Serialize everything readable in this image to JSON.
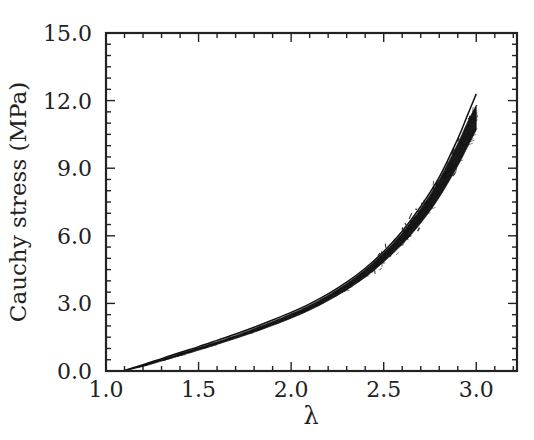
{
  "chart_data": {
    "type": "line",
    "title": "",
    "subtitle": "",
    "xlabel": "λ",
    "ylabel": "Cauchy stress (MPa)",
    "xlim": [
      1.0,
      3.22
    ],
    "ylim": [
      0.0,
      15.0
    ],
    "grid": false,
    "legend": null,
    "legend_position": "none",
    "x_ticks": [
      1.0,
      1.5,
      2.0,
      2.5,
      3.0
    ],
    "x_tick_labels": [
      "1.0",
      "1.5",
      "2.0",
      "2.5",
      "3.0"
    ],
    "y_ticks": [
      0.0,
      3.0,
      6.0,
      9.0,
      12.0,
      15.0
    ],
    "y_tick_labels": [
      "0.0",
      "3.0",
      "6.0",
      "9.0",
      "12.0",
      "15.0"
    ],
    "x_minor_tick_interval": 0.1,
    "y_minor_tick_interval": 0.5,
    "tick_direction": "in",
    "frame": "box",
    "line_color": "#111111",
    "band_color": "#111111",
    "annotations": [],
    "series": [
      {
        "name": "model-curve",
        "role": "upper smooth curve",
        "x": [
          1.09,
          1.2,
          1.3,
          1.4,
          1.5,
          1.6,
          1.7,
          1.8,
          1.9,
          2.0,
          2.1,
          2.2,
          2.3,
          2.4,
          2.5,
          2.6,
          2.7,
          2.8,
          2.9,
          2.95,
          3.0
        ],
        "values": [
          0.0,
          0.28,
          0.55,
          0.82,
          1.08,
          1.36,
          1.64,
          1.94,
          2.26,
          2.6,
          2.98,
          3.42,
          3.94,
          4.56,
          5.3,
          6.2,
          7.3,
          8.6,
          10.3,
          11.3,
          12.3
        ]
      },
      {
        "name": "experimental-band-upper",
        "role": "upper edge of experimental data bundle",
        "x": [
          1.09,
          1.2,
          1.3,
          1.4,
          1.5,
          1.6,
          1.7,
          1.8,
          1.9,
          2.0,
          2.1,
          2.2,
          2.3,
          2.4,
          2.5,
          2.6,
          2.7,
          2.8,
          2.9,
          2.95,
          3.0
        ],
        "values": [
          0.0,
          0.26,
          0.52,
          0.78,
          1.04,
          1.3,
          1.58,
          1.88,
          2.2,
          2.54,
          2.92,
          3.36,
          3.88,
          4.5,
          5.24,
          6.12,
          7.2,
          8.5,
          10.1,
          11.0,
          11.8
        ]
      },
      {
        "name": "experimental-band-lower",
        "role": "lower edge of experimental data bundle",
        "x": [
          1.09,
          1.2,
          1.3,
          1.4,
          1.5,
          1.6,
          1.7,
          1.8,
          1.9,
          2.0,
          2.1,
          2.2,
          2.3,
          2.4,
          2.5,
          2.6,
          2.7,
          2.8,
          2.9,
          2.95,
          3.0
        ],
        "values": [
          0.0,
          0.2,
          0.44,
          0.68,
          0.92,
          1.18,
          1.44,
          1.72,
          2.02,
          2.34,
          2.7,
          3.12,
          3.6,
          4.16,
          4.84,
          5.62,
          6.56,
          7.7,
          9.1,
          9.9,
          10.7
        ]
      }
    ]
  },
  "figure": {
    "background_color": "#ffffff",
    "axis_color": "#222222"
  }
}
